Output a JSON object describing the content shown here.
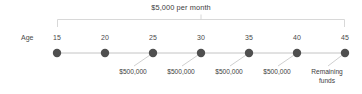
{
  "diagram": {
    "type": "timeline",
    "title": "$5,000 per month",
    "axis_name": "Age",
    "colors": {
      "dot": "#4f4f4f",
      "line": "#bfbfbf",
      "bracket": "#d2d2d2",
      "text": "#3d3d3d"
    },
    "ticks": [
      {
        "age": "15",
        "x": 57,
        "callout": "",
        "has_callout": false
      },
      {
        "age": "20",
        "x": 105,
        "callout": "",
        "has_callout": false
      },
      {
        "age": "25",
        "x": 153,
        "callout": "$500,000",
        "has_callout": true
      },
      {
        "age": "30",
        "x": 201,
        "callout": "$500,000",
        "has_callout": true
      },
      {
        "age": "35",
        "x": 249,
        "callout": "$500,000",
        "has_callout": true
      },
      {
        "age": "40",
        "x": 297,
        "callout": "$500,000",
        "has_callout": true
      },
      {
        "age": "45",
        "x": 345,
        "callout": "Remaining\nfunds",
        "has_callout": true
      }
    ],
    "callouts": [
      {
        "label": "$500,000",
        "x": 133,
        "anchor_x": 153
      },
      {
        "label": "$500,000",
        "x": 181,
        "anchor_x": 201
      },
      {
        "label": "$500,000",
        "x": 229,
        "anchor_x": 249
      },
      {
        "label": "$500,000",
        "x": 277,
        "anchor_x": 297
      },
      {
        "label": "Remaining\nfunds",
        "x": 327,
        "anchor_x": 345
      }
    ]
  }
}
